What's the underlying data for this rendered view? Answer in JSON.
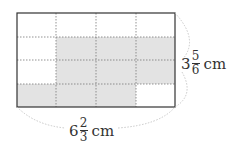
{
  "figure": {
    "grid": {
      "rows": 4,
      "cols": 4,
      "shaded_cells": [
        [
          1,
          1
        ],
        [
          1,
          2
        ],
        [
          1,
          3
        ],
        [
          2,
          1
        ],
        [
          2,
          2
        ],
        [
          2,
          3
        ],
        [
          3,
          0
        ],
        [
          3,
          1
        ],
        [
          3,
          2
        ]
      ],
      "shade_color": "#e3e3e3",
      "border_color": "#333333",
      "grid_line_color": "#777777"
    },
    "height_label": {
      "whole": "3",
      "numerator": "5",
      "denominator": "6",
      "unit": "cm"
    },
    "width_label": {
      "whole": "6",
      "numerator": "2",
      "denominator": "3",
      "unit": "cm"
    }
  }
}
